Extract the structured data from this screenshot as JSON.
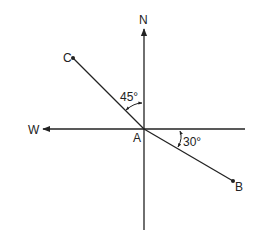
{
  "diagram": {
    "type": "compass-vector-diagram",
    "labels": {
      "north": "N",
      "west": "W",
      "origin": "A",
      "point_b": "B",
      "point_c": "C",
      "angle_c": "45°",
      "angle_b": "30°"
    },
    "angles": {
      "AC_from_north_deg": 45,
      "AB_below_east_deg": 30
    },
    "colors": {
      "line": "#222222",
      "background": "#ffffff"
    }
  }
}
